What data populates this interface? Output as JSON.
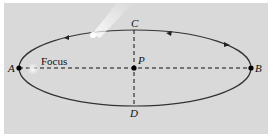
{
  "diagram": {
    "labels": {
      "A": "A",
      "B": "B",
      "C": "C",
      "D": "D",
      "P": "P",
      "focus": "Focus"
    },
    "colors": {
      "background": "#d9d9d9",
      "orbit": "#333333",
      "axes": "#111111",
      "comet": "#ffffff"
    },
    "geometry": {
      "center": [
        134,
        68
      ],
      "semi_major_px": 116,
      "semi_minor_px": 38,
      "focus_x": 38,
      "orbit_direction": "counterclockwise"
    }
  }
}
